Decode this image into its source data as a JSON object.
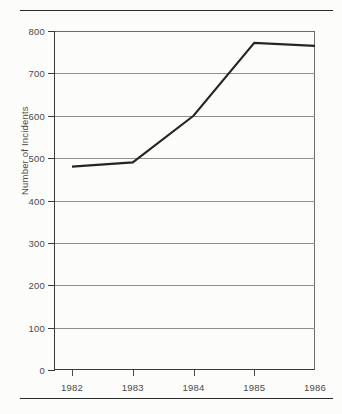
{
  "chart_data": {
    "type": "line",
    "title": "",
    "xlabel": "",
    "ylabel": "Number of Incidents",
    "x": [
      1982,
      1983,
      1984,
      1985,
      1986
    ],
    "categories": [
      "1982",
      "1983",
      "1984",
      "1985",
      "1986"
    ],
    "series": [
      {
        "name": "Number of Incidents",
        "values": [
          480,
          490,
          600,
          772,
          765
        ]
      }
    ],
    "ylim": [
      0,
      800
    ],
    "ytick_values": [
      0,
      100,
      200,
      300,
      400,
      500,
      600,
      700,
      800
    ],
    "ytick_labels": [
      "0",
      "100",
      "200",
      "300",
      "400",
      "500",
      "600",
      "700",
      "800"
    ],
    "xtick_labels": [
      "1982",
      "1983",
      "1984",
      "1985",
      "1986"
    ],
    "grid": "horizontal",
    "legend": "none",
    "line_color": "#252525",
    "grid_color": "#8f8f8f",
    "axis_color": "#3a3a3a"
  },
  "page": {
    "rule_top": "",
    "rule_bottom": ""
  }
}
